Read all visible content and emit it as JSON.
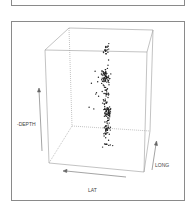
{
  "chart_data": {
    "type": "scatter",
    "subtype": "3d-scatter",
    "title": "",
    "axes": {
      "x": {
        "label": "LAT",
        "direction": "arrow pointing left"
      },
      "y": {
        "label": "LONG",
        "direction": "arrow pointing up/back"
      },
      "z": {
        "label": "-DEPTH",
        "direction": "arrow pointing up"
      }
    },
    "grid": false,
    "legend": null,
    "colors": {
      "points": "#222222",
      "box": "#8a8a8a",
      "axis_arrows": "#555555"
    }
  },
  "labels": {
    "depth": "-DEPTH",
    "long": "LONG",
    "lat": "LAT"
  }
}
